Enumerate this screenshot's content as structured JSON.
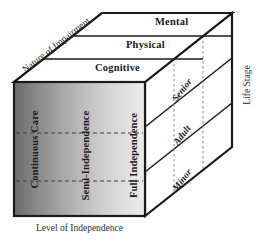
{
  "diagram": {
    "axes": {
      "top_left_diagonal": "Nature of Impairment",
      "right_vertical": "Life Stage",
      "bottom_horizontal": "Level of Independence"
    },
    "top_face_bands": [
      {
        "label": "Mental",
        "position": "back"
      },
      {
        "label": "Physical",
        "position": "middle"
      },
      {
        "label": "Cognitive",
        "position": "front"
      }
    ],
    "front_face_columns": [
      {
        "label": "Continuous Care",
        "position": "left"
      },
      {
        "label": "Semi-Independence",
        "position": "center"
      },
      {
        "label": "Full Independence",
        "position": "right"
      }
    ],
    "right_face_bands": [
      {
        "label": "Senior",
        "position": "top"
      },
      {
        "label": "Adult",
        "position": "middle"
      },
      {
        "label": "Minor",
        "position": "bottom"
      }
    ],
    "colors": {
      "outline": "#1a1a1a",
      "front_gradient_dark": "#6e6e6e",
      "front_gradient_light": "#e4e4e4",
      "face_fill": "#ffffff",
      "dashed_guide": "#555555",
      "text": "#1a1a1a"
    }
  }
}
